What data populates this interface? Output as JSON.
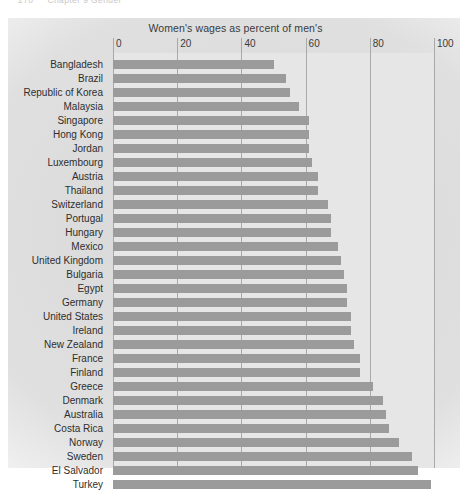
{
  "running_head": {
    "folio": "270",
    "text": "Chapter 9  Gender"
  },
  "chart_data": {
    "type": "bar",
    "orientation": "horizontal",
    "title": "Women's wages as percent of men's",
    "xlabel": "",
    "ylabel": "",
    "xlim": [
      0,
      100
    ],
    "xticks": [
      0,
      20,
      40,
      60,
      80,
      100
    ],
    "xtick_labels": [
      "0",
      "20",
      "40",
      "60",
      "80",
      "100"
    ],
    "grid": true,
    "legend": "none",
    "bar_color": "#9b9b9b",
    "plot_background": "#e6e6e6",
    "categories": [
      "Bangladesh",
      "Brazil",
      "Republic of Korea",
      "Malaysia",
      "Singapore",
      "Hong Kong",
      "Jordan",
      "Luxembourg",
      "Austria",
      "Thailand",
      "Switzerland",
      "Portugal",
      "Hungary",
      "Mexico",
      "United Kingdom",
      "Bulgaria",
      "Egypt",
      "Germany",
      "United States",
      "Ireland",
      "New Zealand",
      "France",
      "Finland",
      "Greece",
      "Denmark",
      "Australia",
      "Costa Rica",
      "Norway",
      "Sweden",
      "El Salvador",
      "Turkey"
    ],
    "values": [
      50,
      54,
      55,
      58,
      61,
      61,
      61,
      62,
      64,
      64,
      67,
      68,
      68,
      70,
      71,
      72,
      73,
      73,
      74,
      74,
      75,
      77,
      77,
      81,
      84,
      85,
      86,
      89,
      93,
      95,
      99
    ]
  }
}
